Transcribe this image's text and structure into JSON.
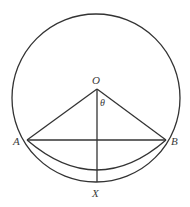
{
  "diagram": {
    "labels": {
      "O": "O",
      "A": "A",
      "B": "B",
      "X": "X",
      "theta": "θ"
    },
    "colors": {
      "stroke": "#333333",
      "label": "#3a3a3a",
      "background": "#ffffff"
    }
  }
}
